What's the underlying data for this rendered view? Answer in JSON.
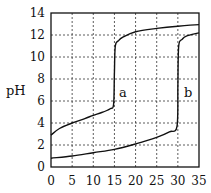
{
  "chart_data": {
    "type": "line",
    "title": "",
    "xlabel": "",
    "ylabel": "pH",
    "xlim": [
      0,
      35
    ],
    "ylim": [
      0,
      14
    ],
    "grid": true,
    "x_ticks": [
      "0",
      "5",
      "10",
      "15",
      "20",
      "25",
      "30",
      "35"
    ],
    "y_ticks": [
      "0",
      "2",
      "4",
      "6",
      "8",
      "10",
      "12",
      "14"
    ],
    "series": [
      {
        "name": "a",
        "x": [
          0,
          2,
          5,
          8,
          10,
          12,
          14,
          14.8,
          15,
          15.2,
          16,
          17,
          20,
          25,
          30,
          35
        ],
        "y": [
          2.9,
          3.5,
          4.0,
          4.4,
          4.7,
          4.95,
          5.3,
          5.7,
          8.5,
          11.0,
          11.5,
          11.8,
          12.3,
          12.6,
          12.8,
          12.95
        ]
      },
      {
        "name": "b",
        "x": [
          0,
          5,
          10,
          15,
          20,
          25,
          28,
          29.8,
          30,
          30.2,
          31,
          32,
          35
        ],
        "y": [
          0.8,
          1.0,
          1.3,
          1.6,
          2.1,
          2.7,
          3.2,
          3.7,
          7.5,
          11.0,
          11.6,
          11.9,
          12.2
        ]
      }
    ],
    "annotations": [
      {
        "text": "a",
        "x": 16.5,
        "y": 6.7
      },
      {
        "text": "b",
        "x": 32.5,
        "y": 6.7
      }
    ]
  },
  "labels": {
    "ylabel": "pH",
    "curve_a": "a",
    "curve_b": "b"
  }
}
